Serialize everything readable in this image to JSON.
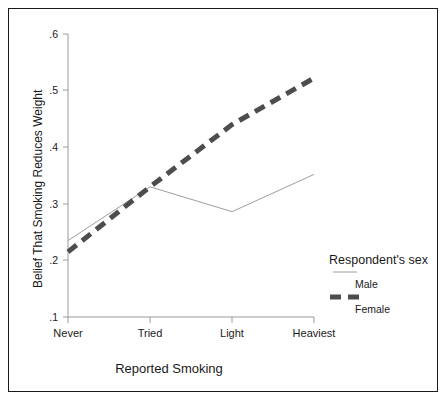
{
  "chart_data": {
    "type": "line",
    "title": "",
    "xlabel": "Reported Smoking",
    "ylabel": "Belief That Smoking Reduces Weight",
    "categories": [
      "Never",
      "Tried",
      "Light",
      "Heaviest"
    ],
    "ylim": [
      0.1,
      0.6
    ],
    "yticks": [
      ".1",
      ".2",
      ".3",
      ".4",
      ".5",
      ".6"
    ],
    "ytick_values": [
      0.1,
      0.2,
      0.3,
      0.4,
      0.5,
      0.6
    ],
    "grid": false,
    "legend_position": "right-inside-lower",
    "legend_title": "Respondent's sex",
    "series": [
      {
        "name": "Male",
        "style": "thin-solid",
        "color": "#8a8a8a",
        "values": [
          0.235,
          0.33,
          0.286,
          0.352
        ]
      },
      {
        "name": "Female",
        "style": "thick-dashed",
        "color": "#4d4d4d",
        "values": [
          0.215,
          0.33,
          0.44,
          0.522
        ]
      }
    ]
  },
  "axes": {
    "y_title": "Belief That Smoking Reduces Weight",
    "x_title": "Reported Smoking",
    "y_tick_labels": [
      ".6",
      ".5",
      ".4",
      ".3",
      ".2",
      ".1"
    ],
    "x_tick_labels": [
      "Never",
      "Tried",
      "Light",
      "Heaviest"
    ]
  },
  "legend": {
    "title": "Respondent's sex",
    "entries": [
      {
        "label": "Male",
        "swatch": "thin-solid-line-swatch"
      },
      {
        "label": "Female",
        "swatch": "thick-dashed-line-swatch"
      }
    ]
  },
  "colors": {
    "frame": "#1a1a1a",
    "axis": "#9a9a9a",
    "male_line": "#8a8a8a",
    "female_line": "#4d4d4d",
    "text": "#1a1a1a",
    "background": "#ffffff"
  }
}
